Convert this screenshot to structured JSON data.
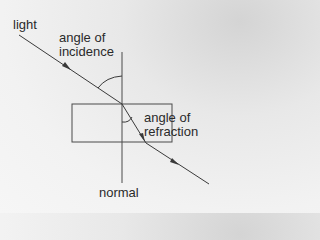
{
  "diagram": {
    "type": "refraction-through-glass-block",
    "labels": {
      "light": "light",
      "incidence_line1": "angle of",
      "incidence_line2": "incidence",
      "refraction_line1": "angle of",
      "refraction_line2": "refraction",
      "normal": "normal"
    },
    "colors": {
      "line": "#3a3a3a",
      "text": "#2a2a2a"
    }
  }
}
